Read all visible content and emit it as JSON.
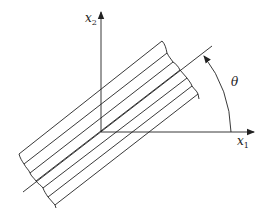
{
  "diagram": {
    "labels": {
      "x1_axis": "x",
      "x1_sub": "1",
      "x2_axis": "x",
      "x2_sub": "2",
      "angle": "θ"
    },
    "colors": {
      "stroke": "#222222",
      "background": "#ffffff"
    },
    "geometry": {
      "origin": [
        101,
        132
      ],
      "x1_axis_end": [
        254,
        132
      ],
      "x2_axis_end": [
        101,
        12
      ],
      "orientation_line": [
        [
          23,
          192
        ],
        [
          212,
          46
        ]
      ],
      "angle_arc_radius": 131,
      "stripe_count": 7
    }
  }
}
